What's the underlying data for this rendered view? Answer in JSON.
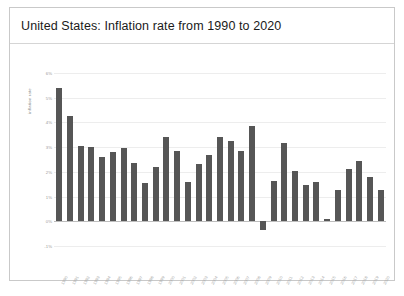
{
  "chart": {
    "title": "United States: Inflation rate from 1990 to 2020"
  },
  "chart_data": {
    "type": "bar",
    "title": "United States: Inflation rate from 1990 to 2020",
    "xlabel": "",
    "ylabel": "inflation rate",
    "ylim": [
      -1,
      6
    ],
    "grid": true,
    "legend": "none",
    "bar_color": "#565656",
    "ytick_labels": [
      "6%",
      "5%",
      "4%",
      "3%",
      "2%",
      "1%",
      "0%",
      "-1%"
    ],
    "ytick_values": [
      6,
      5,
      4,
      3,
      2,
      1,
      0,
      -1
    ],
    "categories": [
      "1990",
      "1991",
      "1992",
      "1993",
      "1994",
      "1995",
      "1996",
      "1997",
      "1998",
      "1999",
      "2000",
      "2001",
      "2002",
      "2003",
      "2004",
      "2005",
      "2006",
      "2007",
      "2008",
      "2009",
      "2010",
      "2011",
      "2012",
      "2013",
      "2014",
      "2015",
      "2016",
      "2017",
      "2018",
      "2019",
      "2020"
    ],
    "values": [
      5.4,
      4.25,
      3.05,
      3.0,
      2.6,
      2.8,
      2.95,
      2.35,
      1.55,
      2.2,
      3.4,
      2.85,
      1.6,
      2.3,
      2.7,
      3.4,
      3.25,
      2.85,
      3.85,
      -0.35,
      1.65,
      3.15,
      2.05,
      1.45,
      1.6,
      0.1,
      1.25,
      2.1,
      2.45,
      1.8,
      1.25
    ]
  }
}
